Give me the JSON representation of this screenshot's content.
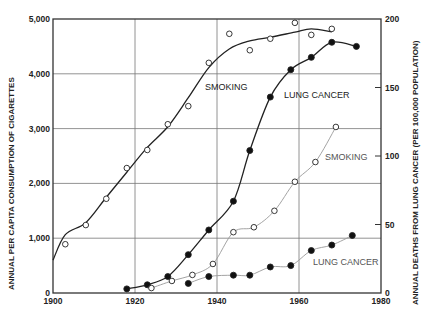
{
  "chart_data": {
    "type": "line",
    "title": "",
    "xlabel": "",
    "ylabel": "ANNUAL PER CAPITA CONSUMPTION OF CIGARETTES",
    "y2label": "ANNUAL DEATHS FROM LUNG CANCER (PER 100,000 POPULATION)",
    "xlim": [
      1900,
      1980
    ],
    "ylim": [
      0,
      5000
    ],
    "y2lim": [
      0,
      200
    ],
    "grid": true,
    "x_ticks": [
      "1900",
      "1920",
      "1940",
      "1960",
      "1980"
    ],
    "y_ticks": [
      "0",
      "1,000",
      "2,000",
      "3,000",
      "4,000",
      "5,000"
    ],
    "y2_ticks": [
      "0",
      "50",
      "100",
      "150",
      "200"
    ],
    "series": [
      {
        "name": "SMOKING",
        "group": "dark",
        "axis": "left",
        "marker": "open-circle",
        "x": [
          1903,
          1908,
          1913,
          1918,
          1923,
          1928,
          1933,
          1938,
          1943,
          1948,
          1953,
          1959,
          1963,
          1968
        ],
        "values": [
          890,
          1240,
          1720,
          2280,
          2610,
          3080,
          3410,
          4200,
          4730,
          4430,
          4640,
          4930,
          4710,
          4820
        ]
      },
      {
        "name": "LUNG CANCER",
        "group": "dark",
        "axis": "right",
        "marker": "filled-circle",
        "x": [
          1918,
          1923,
          1928,
          1933,
          1938,
          1944,
          1948,
          1953,
          1958,
          1963,
          1968,
          1974
        ],
        "values": [
          3,
          6,
          12,
          28,
          46,
          67,
          104,
          143,
          163,
          172,
          183,
          180
        ]
      },
      {
        "name": "SMOKING",
        "group": "light",
        "axis": "left",
        "marker": "open-circle",
        "x": [
          1924,
          1929,
          1934,
          1939,
          1944,
          1949,
          1954,
          1959,
          1964,
          1969
        ],
        "values": [
          90,
          220,
          330,
          530,
          1110,
          1200,
          1500,
          2030,
          2390,
          3030
        ]
      },
      {
        "name": "LUNG CANCER",
        "group": "light",
        "axis": "right",
        "marker": "filled-circle",
        "x": [
          1933,
          1938,
          1944,
          1948,
          1953,
          1958,
          1963,
          1968,
          1973
        ],
        "values": [
          7,
          12,
          13,
          13,
          19,
          20,
          31,
          35,
          42
        ]
      }
    ],
    "annotations": [
      {
        "text": "SMOKING",
        "x": 205,
        "y": 90,
        "style": "dark"
      },
      {
        "text": "LUNG CANCER",
        "x": 284,
        "y": 98,
        "style": "dark"
      },
      {
        "text": "SMOKING",
        "x": 325,
        "y": 160,
        "style": "light"
      },
      {
        "text": "LUNG CANCER",
        "x": 313,
        "y": 265,
        "style": "light"
      }
    ]
  }
}
